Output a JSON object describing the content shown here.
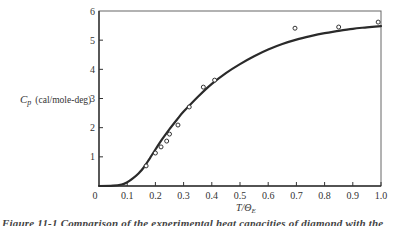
{
  "chart_data": {
    "type": "line",
    "title": "",
    "xlabel": "T/Θ_E",
    "ylabel": "C_p (cal/mole-deg)",
    "xlim": [
      0,
      1.0
    ],
    "ylim": [
      0,
      6
    ],
    "grid": false,
    "legend": null,
    "x_ticks": [
      "0",
      "0.1",
      "0.2",
      "0.3",
      "0.4",
      "0.5",
      "0.6",
      "0.7",
      "0.8",
      "0.9",
      "1.0"
    ],
    "y_ticks": [
      "1",
      "2",
      "3",
      "4",
      "5",
      "6"
    ],
    "series": [
      {
        "name": "Einstein theory (curve)",
        "style": "solid-line",
        "x": [
          0.0,
          0.05,
          0.08,
          0.1,
          0.12,
          0.14,
          0.16,
          0.18,
          0.2,
          0.22,
          0.25,
          0.28,
          0.3,
          0.35,
          0.4,
          0.45,
          0.5,
          0.55,
          0.6,
          0.65,
          0.7,
          0.75,
          0.8,
          0.85,
          0.9,
          0.95,
          1.0
        ],
        "y": [
          0.0,
          0.01,
          0.05,
          0.13,
          0.26,
          0.43,
          0.65,
          0.95,
          1.25,
          1.55,
          1.95,
          2.32,
          2.55,
          3.05,
          3.5,
          3.87,
          4.18,
          4.45,
          4.68,
          4.87,
          5.02,
          5.14,
          5.24,
          5.32,
          5.39,
          5.44,
          5.48
        ]
      },
      {
        "name": "Experimental (diamond)",
        "style": "open-circle",
        "x": [
          0.167,
          0.2,
          0.22,
          0.24,
          0.25,
          0.28,
          0.32,
          0.37,
          0.41,
          0.695,
          0.85,
          0.99
        ],
        "y": [
          0.69,
          1.13,
          1.34,
          1.54,
          1.78,
          2.09,
          2.71,
          3.39,
          3.63,
          5.41,
          5.45,
          5.62
        ]
      }
    ]
  },
  "axes": {
    "y_label_main": "C",
    "y_label_sub": "p",
    "y_label_units": "(cal/mole-deg)",
    "x_label_main": "T/Θ",
    "x_label_sub": "E",
    "origin_label": "0"
  },
  "caption": {
    "text": "Figure 11-1  Comparison of the experimental heat capacities of diamond with the"
  },
  "colors": {
    "ink": "#2a2a2a",
    "frame": "#555555",
    "background": "#ffffff"
  }
}
